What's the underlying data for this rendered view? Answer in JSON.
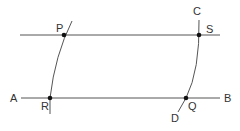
{
  "diagram": {
    "colors": {
      "line": "#555555",
      "point": "#111111",
      "label": "#333333"
    },
    "lines": [
      {
        "id": "top-line",
        "through": [
          "P",
          "S"
        ]
      },
      {
        "id": "line-AB",
        "from": "A",
        "to": "B",
        "through": [
          "R",
          "Q"
        ]
      }
    ],
    "arcs": [
      {
        "id": "arc-left",
        "through": [
          "P",
          "R"
        ]
      },
      {
        "id": "arc-CD",
        "from": "C",
        "to": "D",
        "through": [
          "S",
          "Q"
        ]
      }
    ],
    "points": [
      "P",
      "S",
      "R",
      "Q"
    ],
    "labels": {
      "A": "A",
      "B": "B",
      "C": "C",
      "D": "D",
      "P": "P",
      "Q": "Q",
      "R": "R",
      "S": "S"
    }
  }
}
